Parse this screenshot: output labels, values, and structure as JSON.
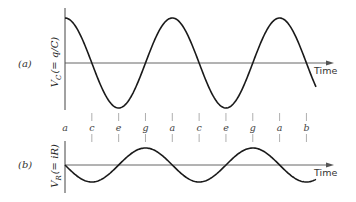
{
  "panels": [
    {
      "id": "a",
      "panel_label": "(a)",
      "ylabel_main": "V",
      "ylabel_sub": "C",
      "ylabel_rest": "(= q/C)",
      "xlabel": "Time",
      "curve": "cosine",
      "description": "Capacitor voltage starts at maximum"
    },
    {
      "id": "b",
      "panel_label": "(b)",
      "ylabel_main": "V",
      "ylabel_sub": "R",
      "ylabel_rest": "(= iR)",
      "xlabel": "Time",
      "curve": "negative sine",
      "description": "Resistor voltage starts at zero, going negative"
    }
  ],
  "phase_markers": [
    "a",
    "c",
    "e",
    "g",
    "a",
    "c",
    "e",
    "g",
    "a",
    "b"
  ],
  "colors": {
    "curve": "#1a1a1a",
    "axis": "#444444",
    "tick": "#9a9a9a",
    "background": "#ffffff"
  }
}
